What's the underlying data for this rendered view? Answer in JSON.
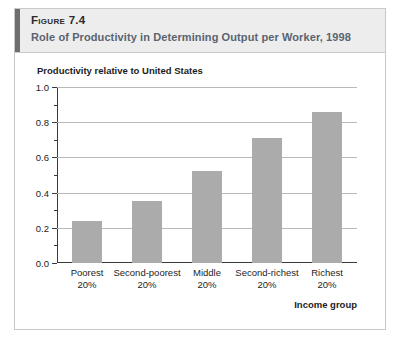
{
  "figure": {
    "number_label": "Figure 7.4",
    "title": "Role of Productivity in Determining Output per Worker, 1998",
    "accent_color": "#6e6e6e",
    "header_bg": "#ededed",
    "title_color": "#5a6470"
  },
  "chart_data": {
    "type": "bar",
    "title": "Role of Productivity in Determining Output per Worker, 1998",
    "ylabel": "Productivity relative to United States",
    "xlabel": "Income group",
    "categories": [
      "Poorest 20%",
      "Second-poorest 20%",
      "Middle 20%",
      "Second-richest 20%",
      "Richest 20%"
    ],
    "category_lines": [
      {
        "line1": "Poorest",
        "line2": "20%"
      },
      {
        "line1": "Second-poorest",
        "line2": "20%"
      },
      {
        "line1": "Middle",
        "line2": "20%"
      },
      {
        "line1": "Second-richest",
        "line2": "20%"
      },
      {
        "line1": "Richest",
        "line2": "20%"
      }
    ],
    "values": [
      0.24,
      0.35,
      0.52,
      0.71,
      0.86
    ],
    "ylim": [
      0.0,
      1.0
    ],
    "ytick_labels": [
      "0.0",
      "0.2",
      "0.4",
      "0.6",
      "0.8",
      "1.0"
    ],
    "ytick_values": [
      0.0,
      0.2,
      0.4,
      0.6,
      0.8,
      1.0
    ],
    "yminor_tick_values": [
      0.1,
      0.3,
      0.5,
      0.7,
      0.9
    ],
    "grid": true,
    "legend": "none",
    "bar_color": "#ababab",
    "gridline_color": "#b9b9b9",
    "axis_color": "#3a3a3a"
  }
}
